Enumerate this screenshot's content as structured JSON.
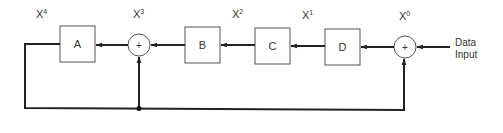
{
  "diagram": {
    "type": "block-diagram",
    "colors": {
      "line": "#222222",
      "box_stroke": "#444444",
      "text": "#333333",
      "background": "#ffffff"
    },
    "blocks": [
      {
        "id": "A",
        "label": "A"
      },
      {
        "id": "B",
        "label": "B"
      },
      {
        "id": "C",
        "label": "C"
      },
      {
        "id": "D",
        "label": "D"
      }
    ],
    "summers": [
      {
        "id": "sum1",
        "symbol": "+"
      },
      {
        "id": "sum2",
        "symbol": "+"
      }
    ],
    "taps": [
      {
        "base": "X",
        "exp": "4"
      },
      {
        "base": "X",
        "exp": "3"
      },
      {
        "base": "X",
        "exp": "2"
      },
      {
        "base": "X",
        "exp": "1"
      },
      {
        "base": "X",
        "exp": "0"
      }
    ],
    "input": {
      "line1": "Data",
      "line2": "Input"
    }
  }
}
